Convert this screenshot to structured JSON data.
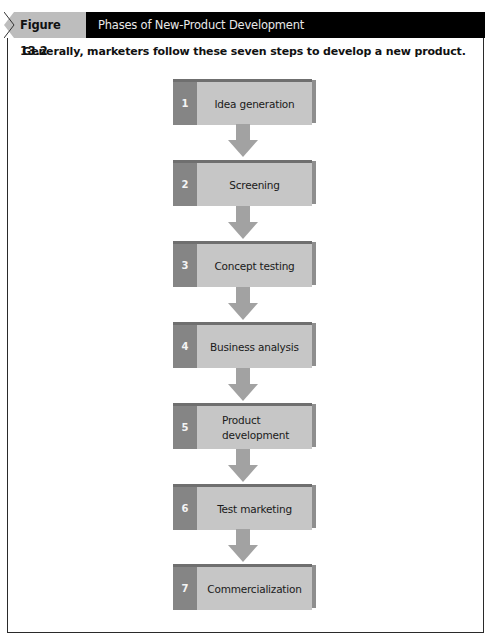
{
  "header": {
    "figure_label": "Figure 13.2",
    "title": "Phases of New-Product Development"
  },
  "subtitle": "Generally, marketers follow these seven steps to develop a new product.",
  "colors": {
    "header_bar": "#000000",
    "figure_tab": "#bdbdbd",
    "step_body": "#c6c6c6",
    "step_number_column": "#858585",
    "step_top_edge": "#6f6f6f",
    "step_right_edge": "#8e8e8e",
    "arrow": "#a2a2a2"
  },
  "steps": [
    {
      "number": "1",
      "label": "Idea generation"
    },
    {
      "number": "2",
      "label": "Screening"
    },
    {
      "number": "3",
      "label": "Concept testing"
    },
    {
      "number": "4",
      "label": "Business analysis"
    },
    {
      "number": "5",
      "label": "Product\ndevelopment"
    },
    {
      "number": "6",
      "label": "Test marketing"
    },
    {
      "number": "7",
      "label": "Commercialization"
    }
  ]
}
